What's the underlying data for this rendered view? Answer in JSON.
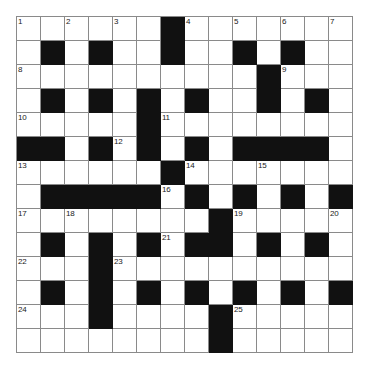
{
  "puzzle": {
    "title": "Crossword Grid",
    "rows": 14,
    "cols": 14,
    "cell_size_px": 24,
    "colors": {
      "block": "#111111",
      "empty": "#ffffff",
      "grid_line": "#8a8a8a",
      "number": "#1a1a1a",
      "page_background": "#ffffff"
    },
    "blocks": [
      [
        0,
        6
      ],
      [
        1,
        1
      ],
      [
        1,
        3
      ],
      [
        1,
        6
      ],
      [
        1,
        9
      ],
      [
        1,
        11
      ],
      [
        2,
        10
      ],
      [
        3,
        1
      ],
      [
        3,
        3
      ],
      [
        3,
        5
      ],
      [
        3,
        7
      ],
      [
        3,
        10
      ],
      [
        3,
        12
      ],
      [
        4,
        5
      ],
      [
        5,
        0
      ],
      [
        5,
        1
      ],
      [
        5,
        3
      ],
      [
        5,
        5
      ],
      [
        5,
        7
      ],
      [
        5,
        9
      ],
      [
        5,
        10
      ],
      [
        5,
        11
      ],
      [
        5,
        12
      ],
      [
        6,
        6
      ],
      [
        7,
        1
      ],
      [
        7,
        2
      ],
      [
        7,
        3
      ],
      [
        7,
        4
      ],
      [
        7,
        5
      ],
      [
        7,
        7
      ],
      [
        7,
        9
      ],
      [
        7,
        11
      ],
      [
        7,
        13
      ],
      [
        8,
        8
      ],
      [
        9,
        1
      ],
      [
        9,
        3
      ],
      [
        9,
        5
      ],
      [
        9,
        7
      ],
      [
        9,
        8
      ],
      [
        9,
        10
      ],
      [
        9,
        12
      ],
      [
        10,
        3
      ],
      [
        11,
        1
      ],
      [
        11,
        3
      ],
      [
        11,
        5
      ],
      [
        11,
        7
      ],
      [
        11,
        9
      ],
      [
        11,
        11
      ],
      [
        11,
        13
      ],
      [
        12,
        3
      ],
      [
        12,
        8
      ],
      [
        13,
        8
      ]
    ],
    "numbers": [
      {
        "n": 1,
        "row": 0,
        "col": 0
      },
      {
        "n": 2,
        "row": 0,
        "col": 2
      },
      {
        "n": 3,
        "row": 0,
        "col": 4
      },
      {
        "n": 4,
        "row": 0,
        "col": 7
      },
      {
        "n": 5,
        "row": 0,
        "col": 9
      },
      {
        "n": 6,
        "row": 0,
        "col": 11
      },
      {
        "n": 7,
        "row": 0,
        "col": 13
      },
      {
        "n": 8,
        "row": 2,
        "col": 0
      },
      {
        "n": 9,
        "row": 2,
        "col": 11
      },
      {
        "n": 10,
        "row": 4,
        "col": 0
      },
      {
        "n": 11,
        "row": 4,
        "col": 6
      },
      {
        "n": 12,
        "row": 5,
        "col": 4
      },
      {
        "n": 13,
        "row": 6,
        "col": 0
      },
      {
        "n": 14,
        "row": 6,
        "col": 7
      },
      {
        "n": 15,
        "row": 6,
        "col": 10
      },
      {
        "n": 16,
        "row": 7,
        "col": 6
      },
      {
        "n": 17,
        "row": 8,
        "col": 0
      },
      {
        "n": 18,
        "row": 8,
        "col": 2
      },
      {
        "n": 19,
        "row": 8,
        "col": 9
      },
      {
        "n": 20,
        "row": 8,
        "col": 13
      },
      {
        "n": 21,
        "row": 9,
        "col": 6
      },
      {
        "n": 22,
        "row": 10,
        "col": 0
      },
      {
        "n": 23,
        "row": 10,
        "col": 4
      },
      {
        "n": 24,
        "row": 12,
        "col": 0
      },
      {
        "n": 25,
        "row": 12,
        "col": 9
      }
    ]
  }
}
